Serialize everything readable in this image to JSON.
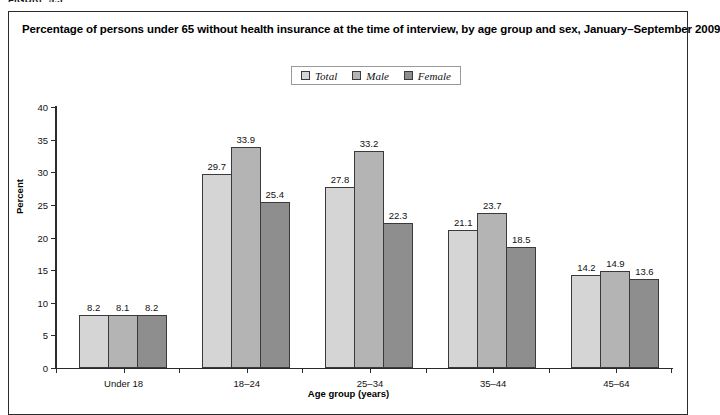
{
  "figure_label": "FIGURE 5.3",
  "title": "Percentage of persons under 65 without health insurance at the time of interview, by age group and sex, January–September 2009",
  "legend": {
    "items": [
      {
        "label": "Total",
        "color": "#d5d5d5"
      },
      {
        "label": "Male",
        "color": "#b4b4b4"
      },
      {
        "label": "Female",
        "color": "#8e8e8e"
      }
    ]
  },
  "axes": {
    "y_title": "Percent",
    "x_title": "Age group (years)",
    "y_ticks": [
      "0",
      "5",
      "10",
      "15",
      "20",
      "25",
      "30",
      "35",
      "40"
    ]
  },
  "chart_data": {
    "type": "bar",
    "title": "Percentage of persons under 65 without health insurance at the time of interview, by age group and sex, January–September 2009",
    "xlabel": "Age group (years)",
    "ylabel": "Percent",
    "ylim": [
      0,
      40
    ],
    "ytick_step": 5,
    "grid": false,
    "legend_position": "top-center",
    "categories": [
      "Under 18",
      "18–24",
      "25–34",
      "35–44",
      "45–64"
    ],
    "series": [
      {
        "name": "Total",
        "color": "#d5d5d5",
        "values": [
          8.2,
          29.7,
          27.8,
          21.1,
          14.2
        ]
      },
      {
        "name": "Male",
        "color": "#b4b4b4",
        "values": [
          8.1,
          33.9,
          33.2,
          23.7,
          14.9
        ]
      },
      {
        "name": "Female",
        "color": "#8e8e8e",
        "values": [
          8.2,
          25.4,
          22.3,
          18.5,
          13.6
        ]
      }
    ]
  }
}
